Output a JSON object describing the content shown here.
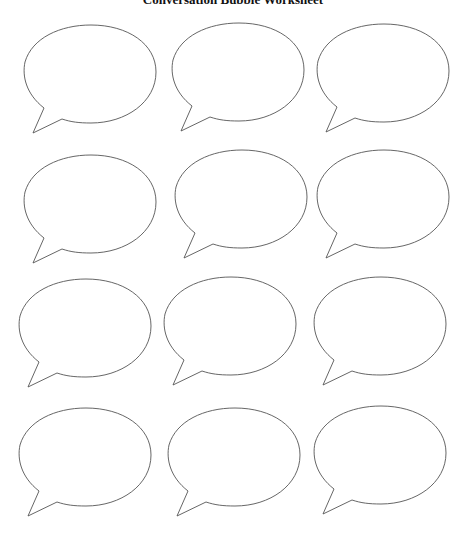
{
  "worksheet": {
    "title": "Conversation Bubble Worksheet",
    "bubble_count": 12,
    "rows": 4,
    "columns": 3,
    "stroke_color": "#555555",
    "fill_color": "#ffffff",
    "bubbles": [
      {
        "row": 1,
        "col": 1,
        "x": 16,
        "y": 20
      },
      {
        "row": 1,
        "col": 2,
        "x": 164,
        "y": 18
      },
      {
        "row": 1,
        "col": 3,
        "x": 309,
        "y": 19
      },
      {
        "row": 2,
        "col": 1,
        "x": 16,
        "y": 150
      },
      {
        "row": 2,
        "col": 2,
        "x": 167,
        "y": 145
      },
      {
        "row": 2,
        "col": 3,
        "x": 309,
        "y": 145
      },
      {
        "row": 3,
        "col": 1,
        "x": 11,
        "y": 274
      },
      {
        "row": 3,
        "col": 2,
        "x": 156,
        "y": 272
      },
      {
        "row": 3,
        "col": 3,
        "x": 306,
        "y": 272
      },
      {
        "row": 4,
        "col": 1,
        "x": 11,
        "y": 403
      },
      {
        "row": 4,
        "col": 2,
        "x": 160,
        "y": 403
      },
      {
        "row": 4,
        "col": 3,
        "x": 306,
        "y": 401
      }
    ]
  }
}
